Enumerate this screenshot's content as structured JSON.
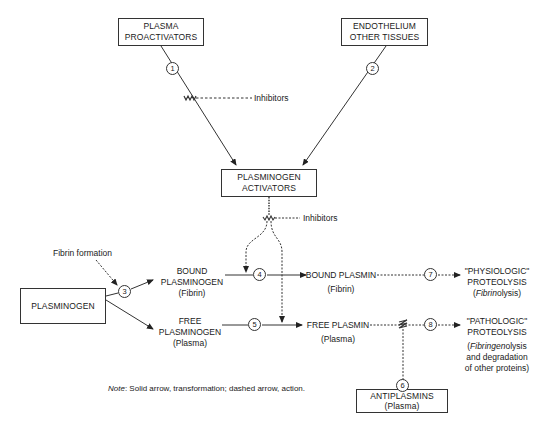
{
  "diagram": {
    "nodes": {
      "plasma_proactivators": {
        "line1": "PLASMA",
        "line2": "PROACTIVATORS"
      },
      "endothelium": {
        "line1": "ENDOTHELIUM",
        "line2": "OTHER TISSUES"
      },
      "plasminogen_activators": {
        "line1": "PLASMINOGEN",
        "line2": "ACTIVATORS"
      },
      "plasminogen": {
        "line1": "PLASMINOGEN"
      },
      "antiplasmins": {
        "line1": "ANTIPLASMINS",
        "line2": "(Plasma)"
      }
    },
    "labels": {
      "inhibitors_top": "Inhibitors",
      "inhibitors_mid": "Inhibitors",
      "fibrin_formation": "Fibrin formation",
      "bound_plasminogen": {
        "line1": "BOUND",
        "line2": "PLASMINOGEN",
        "line3": "(Fibrin)"
      },
      "free_plasminogen": {
        "line1": "FREE",
        "line2": "PLASMINOGEN",
        "line3": "(Plasma)"
      },
      "bound_plasmin": {
        "line1": "BOUND PLASMIN",
        "line2": "(Fibrin)"
      },
      "free_plasmin": {
        "line1": "FREE PLASMIN",
        "line2": "(Plasma)"
      },
      "physiologic": {
        "line1": "\"PHYSIOLOGIC\"",
        "line2": "PROTEOLYSIS",
        "line3_open": "(",
        "line3_italic": "Fibrin",
        "line3_rest": "olysis)"
      },
      "pathologic": {
        "line1": "\"PATHOLOGIC\"",
        "line2": "PROTEOLYSIS",
        "line3_open": "(",
        "line3_italic": "Fibringen",
        "line3_rest": "olysis",
        "line4": "and degradation",
        "line5": "of other proteins)"
      }
    },
    "steps": [
      "1",
      "2",
      "3",
      "4",
      "5",
      "6",
      "7",
      "8"
    ],
    "note": {
      "prefix": "Note",
      "text": ": Solid arrow, transformation; dashed arrow, action."
    },
    "legend": {
      "solid_arrow": "transformation",
      "dashed_arrow": "action"
    }
  }
}
